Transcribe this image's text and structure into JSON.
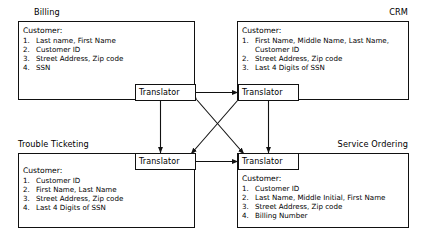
{
  "diagram": {
    "title_present": false,
    "translator_label": "Translator",
    "customer_heading": "Customer:",
    "systems": [
      {
        "id": "billing",
        "label": "Billing",
        "heading": "Customer:",
        "fields": [
          {
            "num": "1.",
            "text": "Last name, First Name"
          },
          {
            "num": "2.",
            "text": "Customer ID"
          },
          {
            "num": "3.",
            "text": "Street Address, Zip code"
          },
          {
            "num": "4.",
            "text": "SSN"
          }
        ],
        "translator": "Translator"
      },
      {
        "id": "crm",
        "label": "CRM",
        "heading": "Customer:",
        "fields": [
          {
            "num": "1.",
            "text": "First Name, Middle Name, Last Name, Customer ID"
          },
          {
            "num": "2.",
            "text": "Street Address, Zip code"
          },
          {
            "num": "3.",
            "text": "Last 4 Digits of SSN"
          }
        ],
        "translator": "Translator"
      },
      {
        "id": "trouble-ticketing",
        "label": "Trouble Ticketing",
        "heading": "Customer:",
        "fields": [
          {
            "num": "1.",
            "text": "Customer ID"
          },
          {
            "num": "2.",
            "text": "First Name, Last Name"
          },
          {
            "num": "3.",
            "text": "Street Address, Zip code"
          },
          {
            "num": "4.",
            "text": "Last 4 Digits of SSN"
          }
        ],
        "translator": "Translator"
      },
      {
        "id": "service-ordering",
        "label": "Service Ordering",
        "heading": "Customer:",
        "fields": [
          {
            "num": "1.",
            "text": "Customer ID"
          },
          {
            "num": "2.",
            "text": "Last Name, Middle Initial, First Name"
          },
          {
            "num": "3.",
            "text": "Street Address, Zip code"
          },
          {
            "num": "4.",
            "text": "Billing Number"
          }
        ],
        "translator": "Translator"
      }
    ],
    "connections": [
      {
        "from": "billing-translator",
        "to": "crm-translator",
        "style": "bidirectional",
        "orientation": "horizontal"
      },
      {
        "from": "trouble-ticketing-translator",
        "to": "service-ordering-translator",
        "style": "bidirectional",
        "orientation": "horizontal"
      },
      {
        "from": "billing-translator",
        "to": "trouble-ticketing-translator",
        "style": "bidirectional",
        "orientation": "vertical"
      },
      {
        "from": "crm-translator",
        "to": "service-ordering-translator",
        "style": "bidirectional",
        "orientation": "vertical"
      },
      {
        "from": "billing-translator",
        "to": "service-ordering-translator",
        "style": "bidirectional",
        "orientation": "diagonal"
      },
      {
        "from": "crm-translator",
        "to": "trouble-ticketing-translator",
        "style": "bidirectional",
        "orientation": "diagonal"
      }
    ],
    "colors": {
      "line": "#111111",
      "background": "#ffffff",
      "text": "#000000"
    }
  }
}
